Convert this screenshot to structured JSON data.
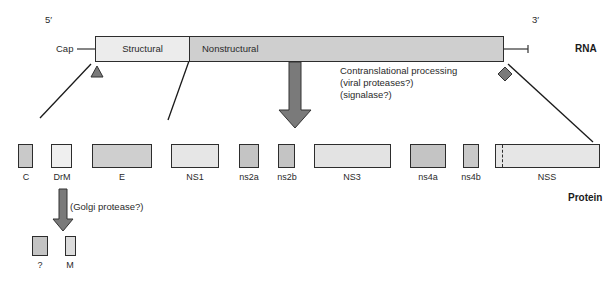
{
  "rna": {
    "five_prime": "5′",
    "three_prime": "3′",
    "cap_label": "Cap",
    "structural_label": "Structural",
    "nonstructural_label": "Nonstructural",
    "row_label": "RNA"
  },
  "processing": {
    "line1": "Contranslational processing",
    "line2": "(viral proteases?)",
    "line3": "(signalase?)",
    "golgi": "(Golgi protease?)"
  },
  "proteins": {
    "row_label": "Protein",
    "items": [
      {
        "name": "C"
      },
      {
        "name": "DrM"
      },
      {
        "name": "E"
      },
      {
        "name": "NS1"
      },
      {
        "name": "ns2a"
      },
      {
        "name": "ns2b"
      },
      {
        "name": "NS3"
      },
      {
        "name": "ns4a"
      },
      {
        "name": "ns4b"
      },
      {
        "name": "NSS"
      }
    ],
    "cleavage_products": [
      {
        "name": "?"
      },
      {
        "name": "M"
      }
    ]
  },
  "colors": {
    "light_fill": "#e6e6e6",
    "mid_fill": "#c9c9c9",
    "arrow_fill": "#7a7a7a",
    "outline": "#2d2d2d"
  }
}
